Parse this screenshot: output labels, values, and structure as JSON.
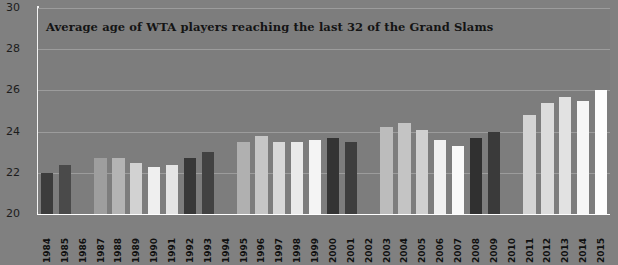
{
  "chart_data": {
    "type": "bar",
    "title": "Average age of WTA players reaching the last 32 of the Grand Slams",
    "xlabel": "",
    "ylabel": "",
    "ylim": [
      20,
      30
    ],
    "yticks": [
      20,
      22,
      24,
      26,
      28,
      30
    ],
    "grid": true,
    "legend": "none",
    "categories": [
      "1984",
      "1985",
      "1986",
      "1987",
      "1988",
      "1989",
      "1990",
      "1991",
      "1992",
      "1993",
      "1994",
      "1995",
      "1996",
      "1997",
      "1998",
      "1999",
      "2000",
      "2001",
      "2002",
      "2003",
      "2004",
      "2005",
      "2006",
      "2007",
      "2008",
      "2009",
      "2010",
      "2011",
      "2012",
      "2013",
      "2014",
      "2015"
    ],
    "values": [
      22.0,
      22.4,
      null,
      22.7,
      22.7,
      22.5,
      22.3,
      22.4,
      22.7,
      23.0,
      null,
      23.5,
      23.8,
      23.5,
      23.5,
      23.6,
      23.7,
      23.5,
      null,
      24.2,
      24.4,
      24.1,
      23.6,
      23.3,
      23.7,
      24.0,
      null,
      24.8,
      25.4,
      25.7,
      25.5,
      26.0
    ],
    "bar_colors": [
      "#3c3c3c",
      "#4a4a4a",
      null,
      "#9e9e9e",
      "#b4b4b4",
      "#d2d2d2",
      "#efefef",
      "#e4e4e4",
      "#383838",
      "#424242",
      null,
      "#b0b0b0",
      "#c6c6c6",
      "#d8d8d8",
      "#eaeaea",
      "#f4f4f4",
      "#343434",
      "#3e3e3e",
      null,
      "#bcbcbc",
      "#c4c4c4",
      "#d0d0d0",
      "#f0f0f0",
      "#fafafa",
      "#303030",
      "#3a3a3a",
      null,
      "#d4d4d4",
      "#dcdcdc",
      "#e2e2e2",
      "#f6f6f6",
      "#fdfdfd"
    ]
  },
  "colors": {
    "background": "#808080",
    "plot_background": "#7d7d7d",
    "gridline": "#9c9c9c",
    "axis": "#ffffff",
    "title_text": "#141414",
    "tick_text": "#1c1c1c"
  }
}
